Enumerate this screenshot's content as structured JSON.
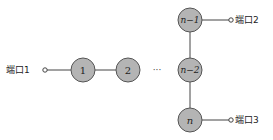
{
  "diagram": {
    "nodes": [
      {
        "id": "1",
        "label": "1",
        "italic": false
      },
      {
        "id": "2",
        "label": "2",
        "italic": false
      },
      {
        "id": "n-2",
        "label": "n−2",
        "italic": true
      },
      {
        "id": "n-1",
        "label": "n−1",
        "italic": true
      },
      {
        "id": "n",
        "label": "n",
        "italic": true
      }
    ],
    "ellipsis": "···",
    "ports": [
      {
        "id": "port1",
        "label": "端口1",
        "attached_to": "1"
      },
      {
        "id": "port2",
        "label": "端口2",
        "attached_to": "n-1"
      },
      {
        "id": "port3",
        "label": "端口3",
        "attached_to": "n"
      }
    ],
    "edges": [
      [
        "port1",
        "1"
      ],
      [
        "1",
        "2"
      ],
      [
        "2",
        "n-2"
      ],
      [
        "n-1",
        "n-2"
      ],
      [
        "n-2",
        "n"
      ],
      [
        "n-1",
        "port2"
      ],
      [
        "n",
        "port3"
      ]
    ],
    "colors": {
      "node_fill": "#b4b4b4",
      "node_stroke": "#555555",
      "line": "#444444"
    }
  }
}
